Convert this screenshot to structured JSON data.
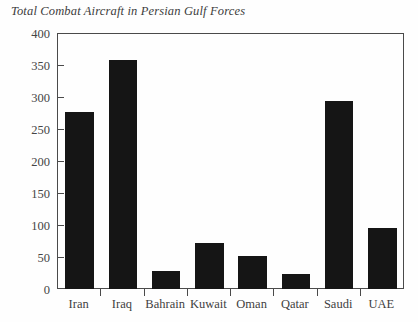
{
  "chart_data": {
    "type": "bar",
    "title": "Total Combat Aircraft in Persian Gulf Forces",
    "xlabel": "",
    "ylabel": "",
    "categories": [
      "Iran",
      "Iraq",
      "Bahrain",
      "Kuwait",
      "Oman",
      "Qatar",
      "Saudi",
      "UAE"
    ],
    "values": [
      277,
      358,
      28,
      72,
      52,
      24,
      293,
      95
    ],
    "ylim": [
      0,
      400
    ],
    "yticks": [
      0,
      50,
      100,
      150,
      200,
      250,
      300,
      350,
      400
    ],
    "ytick_labels": [
      "0",
      "50",
      "100",
      "150",
      "200",
      "250",
      "300",
      "350",
      "400"
    ],
    "grid": false,
    "legend": null,
    "bar_color": "#151515",
    "axis_color": "#4a4a4a",
    "background_color": "#ffffff"
  }
}
